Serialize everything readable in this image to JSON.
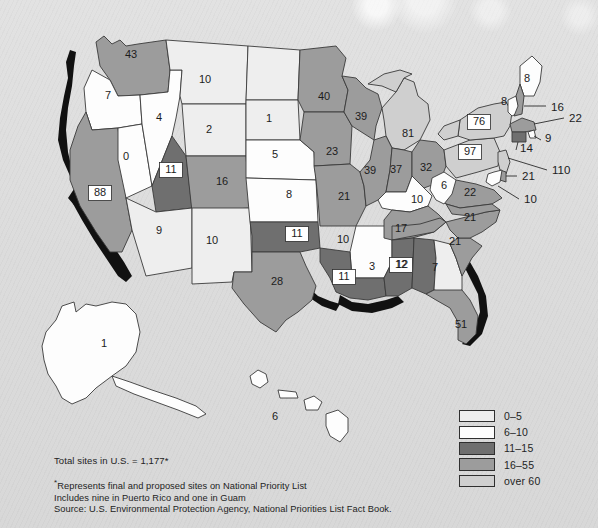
{
  "map": {
    "title_note": "Total sites in U.S. = 1,177*",
    "footnotes": [
      "Represents final and proposed sites on National Priority List",
      "Includes nine in Puerto Rico and one in Guam",
      "Source: U.S. Environmental Protection Agency, National Priorities List Fact Book."
    ]
  },
  "legend": {
    "items": [
      {
        "label": "0–5",
        "color": "#eeeeee",
        "cls": "c0"
      },
      {
        "label": "6–10",
        "color": "#fdfdfd",
        "cls": "c1"
      },
      {
        "label": "11–15",
        "color": "#6f6f6f",
        "cls": "c2"
      },
      {
        "label": "16–55",
        "color": "#9c9c9c",
        "cls": "c3"
      },
      {
        "label": "over 60",
        "color": "#cfcfcf",
        "cls": "c4"
      }
    ]
  },
  "chart_data": {
    "type": "map",
    "value_label": "Number of sites",
    "total": 1177,
    "bins": [
      "0–5",
      "6–10",
      "11–15",
      "16–55",
      "over 60"
    ],
    "states": [
      {
        "code": "WA",
        "value": 43,
        "bin": "16–55",
        "label_x": 131,
        "label_y": 55,
        "boxed": false
      },
      {
        "code": "OR",
        "value": 7,
        "bin": "6–10",
        "label_x": 108,
        "label_y": 96,
        "boxed": false
      },
      {
        "code": "CA",
        "value": 88,
        "bin": "16–55",
        "label_x": 100,
        "label_y": 193,
        "boxed": true
      },
      {
        "code": "NV",
        "value": 0,
        "bin": "0–5",
        "label_x": 126,
        "label_y": 157,
        "boxed": false
      },
      {
        "code": "ID",
        "value": 4,
        "bin": "0–5",
        "label_x": 159,
        "label_y": 118,
        "boxed": false
      },
      {
        "code": "MT",
        "value": 10,
        "bin": "6–10",
        "label_x": 205,
        "label_y": 80,
        "boxed": false
      },
      {
        "code": "WY",
        "value": 2,
        "bin": "0–5",
        "label_x": 209,
        "label_y": 130,
        "boxed": false
      },
      {
        "code": "UT",
        "value": 11,
        "bin": "11–15",
        "label_x": 171,
        "label_y": 170,
        "boxed": true
      },
      {
        "code": "CO",
        "value": 16,
        "bin": "16–55",
        "label_x": 222,
        "label_y": 182,
        "boxed": false
      },
      {
        "code": "AZ",
        "value": 9,
        "bin": "6–10",
        "label_x": 159,
        "label_y": 231,
        "boxed": false
      },
      {
        "code": "NM",
        "value": 10,
        "bin": "6–10",
        "label_x": 212,
        "label_y": 241,
        "boxed": false
      },
      {
        "code": "ND",
        "value": 1,
        "bin": "0–5",
        "label_x": 269,
        "label_y": 119,
        "boxed": false
      },
      {
        "code": "SD",
        "value": 5,
        "bin": "0–5",
        "label_x": 275,
        "label_y": 155,
        "boxed": false
      },
      {
        "code": "NE",
        "value": 8,
        "bin": "6–10",
        "label_x": 289,
        "label_y": 195,
        "boxed": false
      },
      {
        "code": "KS",
        "value": 10,
        "bin": "6–10",
        "label_x": 343,
        "label_y": 240,
        "boxed": false
      },
      {
        "code": "OK",
        "value": 11,
        "bin": "11–15",
        "label_x": 297,
        "label_y": 234,
        "boxed": true
      },
      {
        "code": "TX",
        "value": 28,
        "bin": "16–55",
        "label_x": 277,
        "label_y": 282,
        "boxed": false
      },
      {
        "code": "MN",
        "value": 40,
        "bin": "16–55",
        "label_x": 324,
        "label_y": 97,
        "boxed": false
      },
      {
        "code": "IA",
        "value": 23,
        "bin": "16–55",
        "label_x": 332,
        "label_y": 152,
        "boxed": false
      },
      {
        "code": "MO",
        "value": 21,
        "bin": "16–55",
        "label_x": 344,
        "label_y": 197,
        "boxed": false
      },
      {
        "code": "AR",
        "value": 3,
        "bin": "0–5",
        "label_x": 372,
        "label_y": 267,
        "boxed": false
      },
      {
        "code": "LA",
        "value": 11,
        "bin": "11–15",
        "label_x": 344,
        "label_y": 277,
        "boxed": true
      },
      {
        "code": "WI",
        "value": 39,
        "bin": "16–55",
        "label_x": 361,
        "label_y": 117,
        "boxed": false
      },
      {
        "code": "IL",
        "value": 39,
        "bin": "16–55",
        "label_x": 370,
        "label_y": 171,
        "boxed": false
      },
      {
        "code": "MI",
        "value": 81,
        "bin": "over 60",
        "label_x": 408,
        "label_y": 134,
        "boxed": false
      },
      {
        "code": "IN",
        "value": 37,
        "bin": "16–55",
        "label_x": 396,
        "label_y": 170,
        "boxed": false
      },
      {
        "code": "OH",
        "value": 32,
        "bin": "16–55",
        "label_x": 426,
        "label_y": 168,
        "boxed": false
      },
      {
        "code": "KY",
        "value": 10,
        "bin": "6–10",
        "label_x": 417,
        "label_y": 200,
        "boxed": false
      },
      {
        "code": "TN",
        "value": 17,
        "bin": "16–55",
        "label_x": 401,
        "label_y": 229,
        "boxed": false
      },
      {
        "code": "MS",
        "value": 12,
        "bin": "11–15",
        "label_x": 401,
        "label_y": 265,
        "boxed": true
      },
      {
        "code": "AL",
        "value": 12,
        "bin": "11–15",
        "label_x": 402,
        "label_y": 265,
        "boxed": false
      },
      {
        "code": "GA",
        "value": 7,
        "bin": "6–10",
        "label_x": 435,
        "label_y": 268,
        "boxed": false
      },
      {
        "code": "FL",
        "value": 51,
        "bin": "16–55",
        "label_x": 461,
        "label_y": 325,
        "boxed": false
      },
      {
        "code": "SC",
        "value": 21,
        "bin": "16–55",
        "label_x": 455,
        "label_y": 242,
        "boxed": false
      },
      {
        "code": "NC",
        "value": 21,
        "bin": "16–55",
        "label_x": 470,
        "label_y": 218,
        "boxed": false
      },
      {
        "code": "VA",
        "value": 22,
        "bin": "16–55",
        "label_x": 470,
        "label_y": 193,
        "boxed": false
      },
      {
        "code": "WV",
        "value": 6,
        "bin": "6–10",
        "label_x": 444,
        "label_y": 186,
        "boxed": false
      },
      {
        "code": "PA",
        "value": 97,
        "bin": "over 60",
        "label_x": 470,
        "label_y": 152,
        "boxed": true
      },
      {
        "code": "NY",
        "value": 76,
        "bin": "over 60",
        "label_x": 479,
        "label_y": 122,
        "boxed": true
      },
      {
        "code": "VT",
        "value": 8,
        "bin": "6–10",
        "label_x": 504,
        "label_y": 102,
        "boxed": false
      },
      {
        "code": "ME",
        "value": 8,
        "bin": "6–10",
        "label_x": 527,
        "label_y": 79,
        "boxed": false
      },
      {
        "code": "NH",
        "value": 16,
        "bin": "16–55",
        "label_x": 551,
        "label_y": 107,
        "boxed": false
      },
      {
        "code": "MA",
        "value": 22,
        "bin": "16–55",
        "label_x": 569,
        "label_y": 118,
        "boxed": false
      },
      {
        "code": "RI",
        "value": 9,
        "bin": "6–10",
        "label_x": 545,
        "label_y": 138,
        "boxed": false
      },
      {
        "code": "CT",
        "value": 14,
        "bin": "11–15",
        "label_x": 520,
        "label_y": 148,
        "boxed": false
      },
      {
        "code": "NJ",
        "value": 110,
        "bin": "over 60",
        "label_x": 552,
        "label_y": 170,
        "boxed": false
      },
      {
        "code": "DE",
        "value": 21,
        "bin": "16–55",
        "label_x": 522,
        "label_y": 176,
        "boxed": false
      },
      {
        "code": "MD",
        "value": 10,
        "bin": "6–10",
        "label_x": 524,
        "label_y": 199,
        "boxed": false
      },
      {
        "code": "AK",
        "value": 1,
        "bin": "0–5",
        "label_x": 104,
        "label_y": 344,
        "boxed": false
      },
      {
        "code": "HI",
        "value": 6,
        "bin": "6–10",
        "label_x": 275,
        "label_y": 417,
        "boxed": false
      }
    ]
  }
}
